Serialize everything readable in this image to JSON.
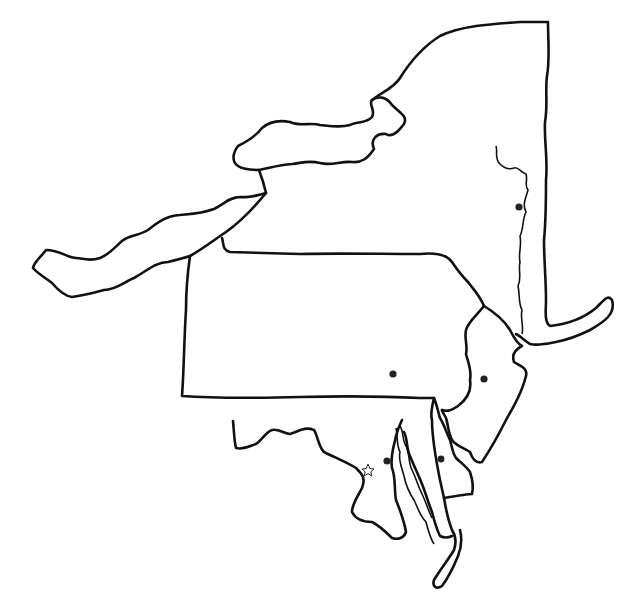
{
  "map": {
    "type": "outline-map",
    "region": "Middle Atlantic states (blank outline)",
    "colors": {
      "background": "#ffffff",
      "line": "#111111",
      "marker": "#222222"
    },
    "regions": [
      {
        "id": "new-york",
        "label": ""
      },
      {
        "id": "pennsylvania",
        "label": ""
      },
      {
        "id": "new-jersey",
        "label": ""
      },
      {
        "id": "delaware",
        "label": ""
      },
      {
        "id": "maryland",
        "label": ""
      },
      {
        "id": "lake-erie",
        "label": ""
      },
      {
        "id": "lake-ontario",
        "label": ""
      }
    ],
    "markers": [
      {
        "id": "capital-new-york",
        "type": "dot",
        "x": 519,
        "y": 207
      },
      {
        "id": "capital-pennsylvania",
        "type": "dot",
        "x": 393,
        "y": 374
      },
      {
        "id": "capital-new-jersey",
        "type": "dot",
        "x": 484,
        "y": 379
      },
      {
        "id": "capital-delaware",
        "type": "dot",
        "x": 441,
        "y": 459
      },
      {
        "id": "capital-maryland",
        "type": "dot",
        "x": 387,
        "y": 461
      },
      {
        "id": "national-capital",
        "type": "star",
        "x": 368,
        "y": 470
      }
    ]
  }
}
